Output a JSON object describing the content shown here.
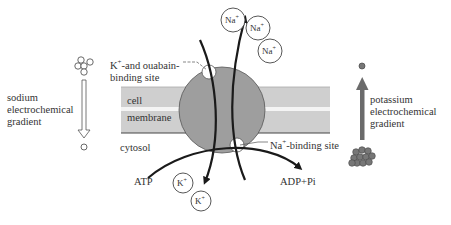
{
  "diagram": {
    "colors": {
      "membrane": "#cfcfcf",
      "membrane_gap": "#f4f4f4",
      "protein": "#9e9e9e",
      "arrow": "#1a1a1a",
      "k_ion_fill": "#777777",
      "potassium_arrow": "#6b6b6b"
    },
    "labels": {
      "binding_site_top_line1": "K",
      "binding_site_top_sup": "+",
      "binding_site_top_line1_rest": "-and ouabain-",
      "binding_site_top_line2": "binding site",
      "cell": "cell",
      "membrane": "membrane",
      "cytosol": "cytosol",
      "na_binding_prefix": "Na",
      "na_binding_sup": "+",
      "na_binding_rest": "-binding site",
      "atp": "ATP",
      "adp_pi": "ADP+Pi",
      "sodium_gradient_line1": "sodium",
      "sodium_gradient_line2": "electrochemical",
      "sodium_gradient_line3": "gradient",
      "potassium_gradient_line1": "potassium",
      "potassium_gradient_line2": "electrochemical",
      "potassium_gradient_line3": "gradient"
    },
    "ions": {
      "sodium": [
        {
          "symbol": "Na",
          "charge": "+",
          "location": "extracellular"
        },
        {
          "symbol": "Na",
          "charge": "+",
          "location": "extracellular"
        },
        {
          "symbol": "Na",
          "charge": "+",
          "location": "extracellular"
        }
      ],
      "potassium": [
        {
          "symbol": "K",
          "charge": "+",
          "location": "cytosol"
        },
        {
          "symbol": "K",
          "charge": "+",
          "location": "cytosol"
        }
      ]
    }
  }
}
